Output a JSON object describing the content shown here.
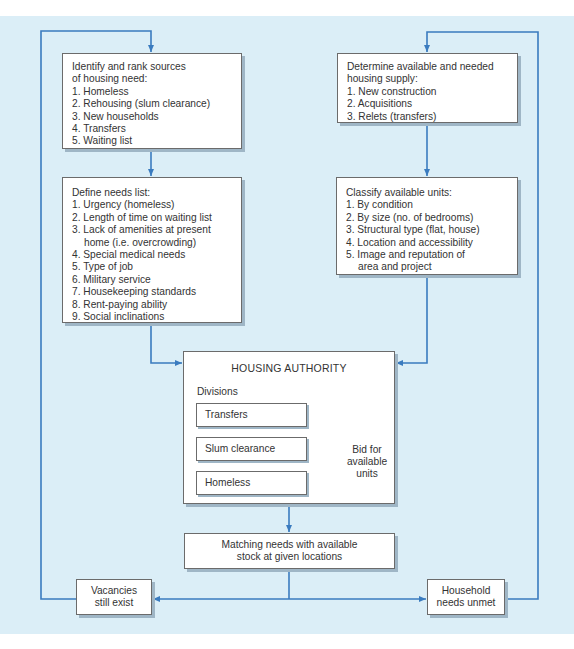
{
  "colors": {
    "background": "#dbeef7",
    "line": "#3a7bbf",
    "box_border": "#6b6b6b",
    "box_fill": "#ffffff"
  },
  "left_column": {
    "sources_box": {
      "heading": [
        "Identify and rank sources",
        "of housing need:"
      ],
      "items": [
        "1. Homeless",
        "2. Rehousing (slum clearance)",
        "3. New households",
        "4. Transfers",
        "5. Waiting list"
      ]
    },
    "needs_box": {
      "heading": "Define needs list:",
      "items": [
        "1. Urgency (homeless)",
        "2. Length of time on waiting list",
        "3. Lack of amenities at present",
        "home (i.e. overcrowding)",
        "4. Special medical needs",
        "5. Type of job",
        "6. Military service",
        "7. Housekeeping standards",
        "8. Rent-paying ability",
        "9. Social inclinations"
      ]
    }
  },
  "right_column": {
    "supply_box": {
      "heading": [
        "Determine available and needed",
        "housing supply:"
      ],
      "items": [
        "1. New construction",
        "2. Acquisitions",
        "3. Relets (transfers)"
      ]
    },
    "classify_box": {
      "heading": "Classify available units:",
      "items": [
        "1. By condition",
        "2. By size (no. of bedrooms)",
        "3. Structural type (flat, house)",
        "4. Location and accessibility",
        "5. Image and reputation of",
        "area and project"
      ]
    }
  },
  "housing_authority": {
    "title": "HOUSING AUTHORITY",
    "divisions_label": "Divisions",
    "divisions": [
      "Transfers",
      "Slum clearance",
      "Homeless"
    ],
    "bid_label": [
      "Bid for",
      "available",
      "units"
    ]
  },
  "matching_box": [
    "Matching needs with available",
    "stock at given locations"
  ],
  "vacancies_box": [
    "Vacancies",
    "still exist"
  ],
  "unmet_box": [
    "Household",
    "needs unmet"
  ]
}
